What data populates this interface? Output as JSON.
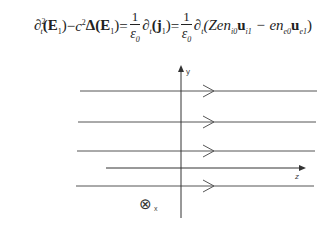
{
  "equation": {
    "lhs_term1": "∂",
    "lhs_term1_sup": "2",
    "lhs_term1_sub": "t",
    "lhs_term1_arg": "(E",
    "lhs_term1_arg_sub": "1",
    "lhs_term1_close": ")",
    "minus": " − ",
    "c": "c",
    "c_sup": "2",
    "delta": "Δ(E",
    "delta_sub": "1",
    "delta_close": ")",
    "eq1": " = ",
    "frac1_num": "1",
    "frac1_den": "ε",
    "frac1_den_sub": "0",
    "d2": "∂",
    "d2_sub": "t",
    "j": "(j",
    "j_sub": "1",
    "j_close": ")",
    "eq2": " = ",
    "frac2_num": "1",
    "frac2_den": "ε",
    "frac2_den_sub": "0",
    "d3": "∂",
    "d3_sub": "t",
    "paren_open": "(Zen",
    "n_i0_sub": "i0",
    "u_i1": "u",
    "u_i1_sub": "i1",
    "minus2": " − en",
    "n_e0_sub": "e0",
    "u_e1": "u",
    "u_e1_sub": "e1",
    "paren_close": ")"
  },
  "diagram": {
    "axis_y_label": "y",
    "axis_z_label": "z",
    "axis_x_label": "x",
    "x_symbol": "⊗",
    "field_lines": [
      {
        "y": 41,
        "x1": 80,
        "x2": 317,
        "arrow": true
      },
      {
        "y": 72,
        "x1": 78,
        "x2": 316,
        "arrow": true
      },
      {
        "y": 101,
        "x1": 77,
        "x2": 315,
        "arrow": true
      },
      {
        "y": 136,
        "x1": 76,
        "x2": 314,
        "arrow": true
      }
    ],
    "z_axis": {
      "y": 118,
      "x1": 106,
      "x2": 306
    },
    "y_axis": {
      "x": 181,
      "y1": 15,
      "y2": 168
    }
  }
}
